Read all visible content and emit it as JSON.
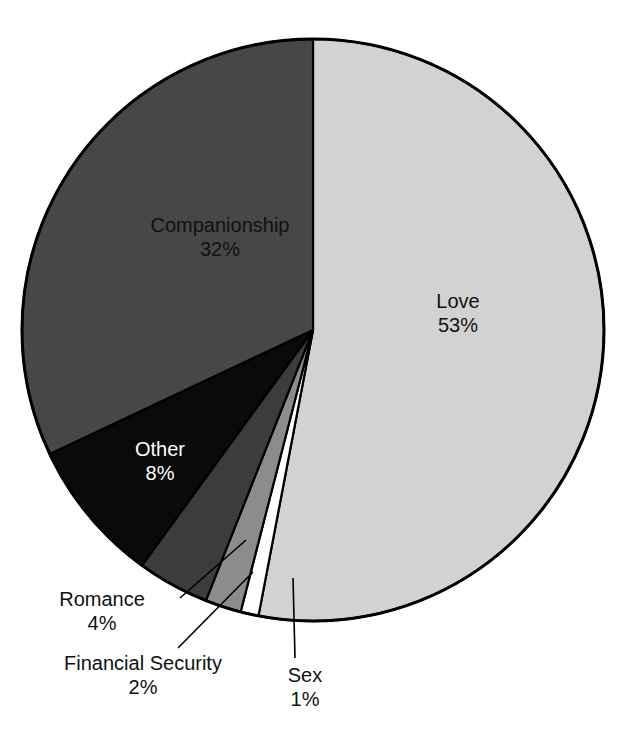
{
  "chart_data": {
    "type": "pie",
    "title_visible_fragment": "",
    "categories": [
      "Love",
      "Sex",
      "Financial Security",
      "Romance",
      "Other",
      "Companionship"
    ],
    "values": [
      53,
      1,
      2,
      4,
      8,
      32
    ],
    "value_unit": "%",
    "slices": [
      {
        "label": "Love",
        "value": 53,
        "pct_text": "53%",
        "color": "#d2d2d2",
        "text_color": "#111111",
        "start_angle": 0,
        "end_angle": 190.8
      },
      {
        "label": "Sex",
        "value": 1,
        "pct_text": "1%",
        "color": "#ffffff",
        "text_color": "#111111",
        "start_angle": 190.8,
        "end_angle": 194.4
      },
      {
        "label": "Financial Security",
        "value": 2,
        "pct_text": "2%",
        "color": "#8c8c8c",
        "text_color": "#111111",
        "start_angle": 194.4,
        "end_angle": 201.6
      },
      {
        "label": "Romance",
        "value": 4,
        "pct_text": "4%",
        "color": "#3c3c3c",
        "text_color": "#111111",
        "start_angle": 201.6,
        "end_angle": 216.0
      },
      {
        "label": "Other",
        "value": 8,
        "pct_text": "8%",
        "color": "#0a0a0a",
        "text_color": "#ffffff",
        "start_angle": 216.0,
        "end_angle": 244.8
      },
      {
        "label": "Companionship",
        "value": 32,
        "pct_text": "32%",
        "color": "#474747",
        "text_color": "#111111",
        "start_angle": 244.8,
        "end_angle": 360.0
      }
    ],
    "legend": "none",
    "grid": false,
    "xlabel": "",
    "ylabel": "",
    "outline_color": "#000000",
    "background": "#ffffff",
    "geometry": {
      "cx": 313,
      "cy": 330,
      "r": 291
    }
  },
  "labels": {
    "companionship": {
      "name": "Companionship",
      "pct": "32%"
    },
    "love": {
      "name": "Love",
      "pct": "53%"
    },
    "other": {
      "name": "Other",
      "pct": "8%"
    },
    "romance": {
      "name": "Romance",
      "pct": "4%"
    },
    "financial": {
      "name": "Financial Security",
      "pct": "2%"
    },
    "sex": {
      "name": "Sex",
      "pct": "1%"
    }
  }
}
